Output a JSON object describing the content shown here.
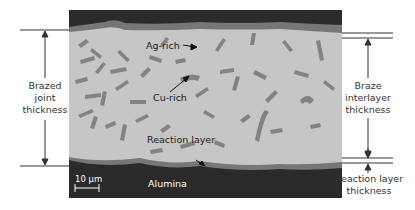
{
  "figure": {
    "type": "SEM cross-section micrograph of brazed joint",
    "colors": {
      "alumina": "#2b2b2b",
      "reaction_layer": "#7a7a7a",
      "ag_rich": "#c8c8c8",
      "cu_rich": "#858585",
      "annotation_lines": "#333333"
    },
    "inner_labels": {
      "ag_rich": "Ag-rich",
      "cu_rich": "Cu-rich",
      "reaction_layer": "Reaction layer",
      "alumina": "Alumina",
      "scale_bar": "10 μm"
    },
    "left_dimension": {
      "line1": "Brazed",
      "line2": "joint",
      "line3": "thickness"
    },
    "right_dimension_braze": {
      "line1": "Braze",
      "line2": "interlayer",
      "line3": "thickness"
    },
    "right_dimension_reaction": {
      "line1": "Reaction layer",
      "line2": "thickness"
    }
  }
}
